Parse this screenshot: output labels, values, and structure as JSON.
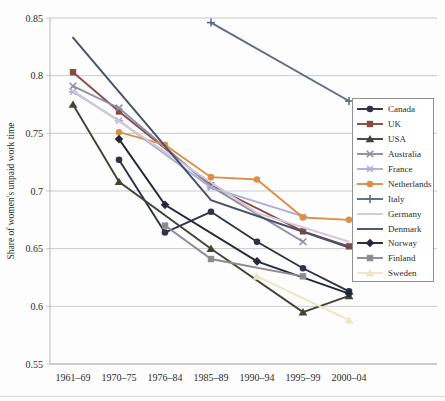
{
  "figure": {
    "y_axis_title": "Share of women's unpaid work time"
  },
  "chart_data": {
    "type": "line",
    "title": "",
    "xlabel": "",
    "ylabel": "Share of women's unpaid work time",
    "ylim": [
      0.55,
      0.85
    ],
    "grid": "horizontal-gridlines",
    "legend_position": "right-overlay",
    "yticks": [
      {
        "v": 0.85,
        "label": "0.85"
      },
      {
        "v": 0.8,
        "label": "0.8"
      },
      {
        "v": 0.75,
        "label": "0.75"
      },
      {
        "v": 0.7,
        "label": "0.7"
      },
      {
        "v": 0.65,
        "label": "0.65"
      },
      {
        "v": 0.6,
        "label": "0.6"
      },
      {
        "v": 0.55,
        "label": "0.55"
      }
    ],
    "categories": [
      "1961–69",
      "1970–75",
      "1976–84",
      "1985–89",
      "1990–94",
      "1995–99",
      "2000–04"
    ],
    "series": [
      {
        "name": "Canada",
        "color": "#2e3248",
        "marker": "circle",
        "values": [
          null,
          0.727,
          0.664,
          0.682,
          0.656,
          0.633,
          0.613
        ]
      },
      {
        "name": "UK",
        "color": "#8a4b42",
        "marker": "square",
        "values": [
          0.803,
          0.769,
          null,
          0.705,
          null,
          0.665,
          0.652
        ]
      },
      {
        "name": "USA",
        "color": "#3f4636",
        "marker": "triangle",
        "values": [
          0.775,
          0.708,
          null,
          0.65,
          null,
          0.595,
          0.609
        ]
      },
      {
        "name": "Australia",
        "color": "#8f8ea6",
        "marker": "x",
        "values": [
          0.791,
          0.772,
          null,
          0.704,
          null,
          0.656,
          null
        ]
      },
      {
        "name": "France",
        "color": "#a9afd8",
        "marker": "star",
        "values": [
          0.786,
          0.761,
          null,
          0.703,
          null,
          0.678,
          null
        ]
      },
      {
        "name": "Netherlands",
        "color": "#db8f4a",
        "marker": "circle",
        "values": [
          null,
          0.751,
          0.74,
          0.712,
          0.71,
          0.677,
          0.675
        ]
      },
      {
        "name": "Italy",
        "color": "#5e6c86",
        "marker": "plus",
        "values": [
          null,
          null,
          null,
          0.846,
          null,
          null,
          0.778
        ]
      },
      {
        "name": "Germany",
        "color": "#d4c9d8",
        "marker": "none",
        "values": [
          0.787,
          null,
          null,
          null,
          0.681,
          null,
          0.656
        ]
      },
      {
        "name": "Denmark",
        "color": "#46516b",
        "marker": "none",
        "values": [
          0.833,
          null,
          null,
          0.692,
          null,
          null,
          0.651
        ]
      },
      {
        "name": "Norway",
        "color": "#23283a",
        "marker": "diamond",
        "values": [
          null,
          0.745,
          0.688,
          null,
          0.639,
          null,
          0.611
        ]
      },
      {
        "name": "Finland",
        "color": "#8e8b8e",
        "marker": "square",
        "values": [
          null,
          null,
          0.67,
          0.641,
          null,
          0.626,
          null
        ]
      },
      {
        "name": "Sweden",
        "color": "#ece7c3",
        "marker": "triangle",
        "values": [
          null,
          null,
          null,
          null,
          0.626,
          null,
          0.588
        ]
      }
    ]
  }
}
